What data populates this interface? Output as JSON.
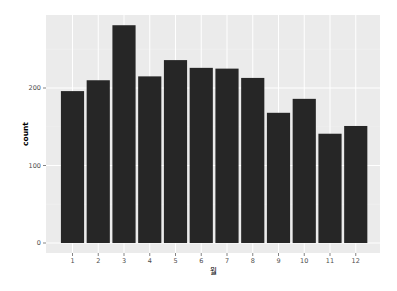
{
  "chart_data": {
    "type": "bar",
    "title": "",
    "xlabel": "월",
    "ylabel": "count",
    "categories": [
      "1",
      "2",
      "3",
      "4",
      "5",
      "6",
      "7",
      "8",
      "9",
      "10",
      "11",
      "12"
    ],
    "values": [
      196,
      210,
      281,
      215,
      236,
      226,
      225,
      213,
      168,
      186,
      141,
      151
    ],
    "ylim": [
      0,
      295
    ],
    "yticks": [
      0,
      100,
      200
    ],
    "grid": true,
    "legend": null,
    "colors": {
      "bar": "#262626",
      "panel_background": "#ebebeb",
      "grid_major": "#ffffff",
      "grid_minor": "#f2f2f2",
      "text": "#4d4d4d"
    }
  }
}
